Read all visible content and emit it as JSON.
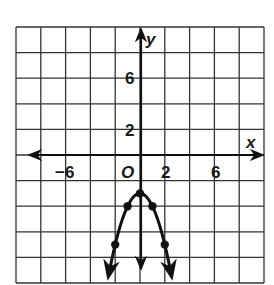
{
  "chart_data": {
    "type": "line",
    "title": "",
    "xlabel": "x",
    "ylabel": "y",
    "xlim": [
      -10,
      10
    ],
    "ylim": [
      -10,
      10
    ],
    "grid": true,
    "grid_step": 2,
    "x_tick_labels": [
      {
        "value": -6,
        "label": "−6"
      },
      {
        "value": 2,
        "label": "2"
      },
      {
        "value": 6,
        "label": "6"
      }
    ],
    "y_tick_labels": [
      {
        "value": 6,
        "label": "6"
      },
      {
        "value": 2,
        "label": "2"
      }
    ],
    "origin_label": "O",
    "series": [
      {
        "name": "parabola",
        "equation": "y = -x^2 - 3",
        "points": [
          {
            "x": -2,
            "y": -7
          },
          {
            "x": -1,
            "y": -4
          },
          {
            "x": 0,
            "y": -3
          },
          {
            "x": 1,
            "y": -4
          },
          {
            "x": 2,
            "y": -7
          }
        ],
        "arrows_at_ends": true,
        "color": "#111111"
      }
    ]
  },
  "labels": {
    "x_axis": "x",
    "y_axis": "y",
    "origin": "O",
    "x_ticks": [
      "−6",
      "2",
      "6"
    ],
    "y_ticks": [
      "6",
      "2"
    ]
  }
}
